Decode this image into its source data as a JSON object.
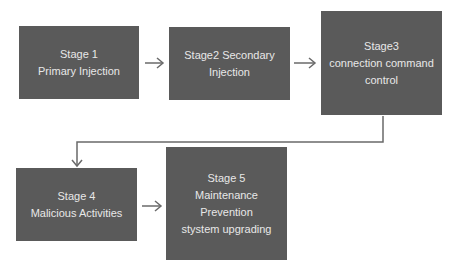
{
  "diagram": {
    "stages": [
      {
        "id": "stage1",
        "lines": [
          "Stage 1",
          "Primary  Injection"
        ]
      },
      {
        "id": "stage2",
        "lines": [
          "Stage2   Secondary",
          "Injection"
        ]
      },
      {
        "id": "stage3",
        "lines": [
          "Stage3",
          "connection  command",
          "control"
        ]
      },
      {
        "id": "stage4",
        "lines": [
          "Stage 4",
          "Malicious Activities"
        ]
      },
      {
        "id": "stage5",
        "lines": [
          "Stage 5",
          "Maintenance",
          "Prevention",
          "stystem  upgrading"
        ]
      }
    ],
    "arrows": [
      {
        "from": "stage1",
        "to": "stage2"
      },
      {
        "from": "stage2",
        "to": "stage3"
      },
      {
        "from": "stage3",
        "to": "stage4"
      },
      {
        "from": "stage4",
        "to": "stage5"
      }
    ],
    "colors": {
      "box_fill": "#5a5a5a",
      "box_text": "#e8e8e8",
      "arrow": "#6a6a6a",
      "background": "#ffffff"
    }
  }
}
